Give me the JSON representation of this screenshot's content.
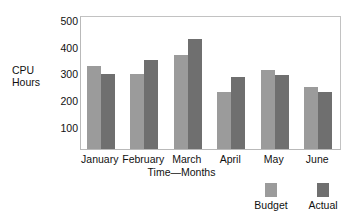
{
  "chart_data": {
    "type": "bar",
    "title": "",
    "xlabel": "Time—Months",
    "ylabel": "CPU Hours",
    "ylabel_lines": [
      "CPU",
      "Hours"
    ],
    "categories": [
      "January",
      "February",
      "March",
      "April",
      "May",
      "June"
    ],
    "series": [
      {
        "name": "Budget",
        "color": "#9b9b9b",
        "values": [
          330,
          300,
          370,
          230,
          315,
          250
        ]
      },
      {
        "name": "Actual",
        "color": "#6f6f6f",
        "values": [
          300,
          350,
          428,
          285,
          293,
          232
        ]
      }
    ],
    "yticks": [
      100,
      200,
      300,
      400,
      500
    ],
    "ytick_labels": [
      "100",
      "200",
      "300",
      "400",
      "500"
    ],
    "ylim": [
      16,
      520
    ],
    "grid": false,
    "legend_position": "bottom-right",
    "legend": [
      "Budget",
      "Actual"
    ],
    "plot_border_color": "#b9b9b9",
    "background": "#ffffff"
  }
}
